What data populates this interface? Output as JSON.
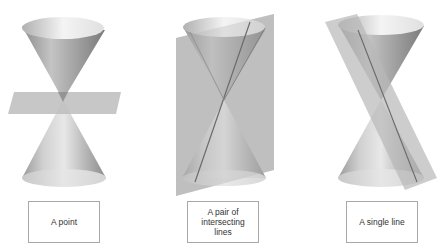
{
  "figures": [
    {
      "id": "point",
      "label": "A point",
      "description": "Double cone cut by a horizontal plane through the vertex"
    },
    {
      "id": "intersecting-lines",
      "label": "A pair of\nintersecting\nlines",
      "description": "Double cone cut by a vertical plane through the vertex"
    },
    {
      "id": "single-line",
      "label": "A single line",
      "description": "Double cone cut by a tilted plane tangent along one generator"
    }
  ],
  "colors": {
    "cone_light": "#f2f2f2",
    "cone_mid": "#b5b5b5",
    "cone_dark": "#7a7a7a",
    "plane": "#bdbdbd",
    "box_border": "#a8a8a8",
    "text": "#333333"
  }
}
